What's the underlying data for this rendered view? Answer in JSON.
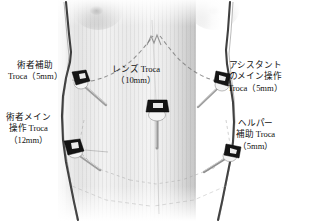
{
  "figure": {
    "type": "medical-illustration",
    "background_color": "#ffffff",
    "skin_tone_color": "#e9e9e9",
    "contour_color": "#2b2b2b",
    "landmark_line_color": "#8a8a8a",
    "trocar_head_color": "#1a1a1a",
    "trocar_collar_color": "#f2f2f2",
    "trocar_shaft_color": "#9a9a9a"
  },
  "labels": {
    "surgeon_assist": {
      "line1": "術者補助",
      "line2": "Troca（5mm）",
      "position": "top-left"
    },
    "surgeon_main": {
      "line1": "術者メイン",
      "line2": "操作 Troca",
      "line3": "（12mm）",
      "position": "bottom-left"
    },
    "lens": {
      "line1": "レンズ Troca",
      "line2": "（10mm）",
      "position": "center"
    },
    "assistant_main": {
      "line1": "アシスタント",
      "line2": "のメイン操作",
      "line3": "Troca（5mm）",
      "position": "top-right"
    },
    "helper_assist": {
      "line1": "ヘルパー",
      "line2": "補助 Troca",
      "line3": "（5mm）",
      "position": "bottom-right"
    }
  },
  "trocars": [
    {
      "name": "surgeon-assist-trocar",
      "size": "5mm",
      "x": 79,
      "y": 79,
      "shaft_angle_deg": 38,
      "shaft_len": 30
    },
    {
      "name": "lens-trocar",
      "size": "10mm",
      "x": 157,
      "y": 107,
      "shaft_angle_deg": 90,
      "shaft_len": 34
    },
    {
      "name": "assistant-main-trocar",
      "size": "5mm",
      "x": 225,
      "y": 80,
      "shaft_angle_deg": 142,
      "shaft_len": 30
    },
    {
      "name": "surgeon-main-trocar",
      "size": "12mm",
      "x": 72,
      "y": 147,
      "shaft_angle_deg": 30,
      "shaft_len": 30
    },
    {
      "name": "helper-assist-trocar",
      "size": "5mm",
      "x": 233,
      "y": 150,
      "shaft_angle_deg": 152,
      "shaft_len": 28
    }
  ],
  "landmarks": {
    "costal_margin": "dashed rib-arch curve with xiphoid notch at apex",
    "pelvic_outline": "faint dashed lines converging toward the pelvis",
    "midline": "faint vertical linea alba"
  }
}
